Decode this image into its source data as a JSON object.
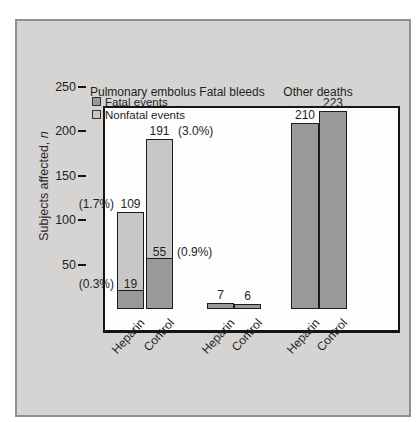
{
  "figure": {
    "panel_bg": "#d5d4d2",
    "panel_border": "#8f8f8f",
    "plot_bg": "#fdfdfd",
    "axis_color": "#151515",
    "fatal_color": "#9b989a",
    "nonfatal_color": "#c8c6c6"
  },
  "chart_data": {
    "type": "bar",
    "title": "",
    "ylabel": "Subjects affected, n",
    "xlabel": "",
    "yticks": [
      50,
      100,
      150,
      200,
      250
    ],
    "ylim": [
      0,
      250
    ],
    "grid": false,
    "legend_position": "top-left inside plot",
    "legend": [
      {
        "label": "Fatal events",
        "color": "#9b989a"
      },
      {
        "label": "Nonfatal events",
        "color": "#c8c6c6"
      }
    ],
    "groups": [
      {
        "label": "Pulmonary embolus",
        "bars": [
          {
            "category": "Heparin",
            "stacked": true,
            "fatal": 19,
            "nonfatal": 90,
            "total": 109,
            "fatal_label": "19",
            "total_label": "109",
            "fatal_pct": "(0.3%)",
            "total_pct": "(1.7%)",
            "pct_side": "left"
          },
          {
            "category": "Control",
            "stacked": true,
            "fatal": 55,
            "nonfatal": 136,
            "total": 191,
            "fatal_label": "55",
            "total_label": "191",
            "fatal_pct": "(0.9%)",
            "total_pct": "(3.0%)",
            "pct_side": "right"
          }
        ]
      },
      {
        "label": "Fatal bleeds",
        "bars": [
          {
            "category": "Heparin",
            "stacked": false,
            "total": 7,
            "total_label": "7"
          },
          {
            "category": "Control",
            "stacked": false,
            "total": 6,
            "total_label": "6"
          }
        ]
      },
      {
        "label": "Other deaths",
        "bars": [
          {
            "category": "Heparin",
            "stacked": false,
            "total": 210,
            "total_label": "210"
          },
          {
            "category": "Control",
            "stacked": false,
            "total": 223,
            "total_label": "223"
          }
        ]
      }
    ]
  }
}
